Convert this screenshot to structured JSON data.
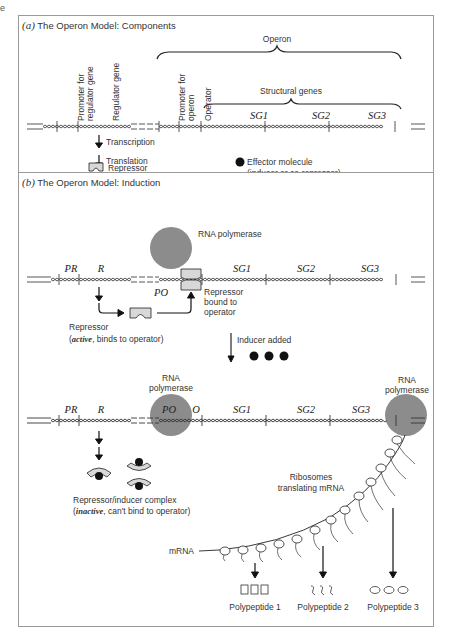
{
  "edge_fragment": "e",
  "panel_a": {
    "letter": "(a)",
    "title": "The Operon Model: Components",
    "operon_label": "Operon",
    "structural_genes_label": "Structural genes",
    "vertical_labels": [
      "Promoter for regulator gene",
      "Regulator gene",
      "Promoter for operon",
      "Operator"
    ],
    "vertical_lines": [
      [
        "Promoter for",
        "regulator gene"
      ],
      [
        "Regulator gene"
      ],
      [
        "Promoter for",
        "operon"
      ],
      [
        "Operator"
      ]
    ],
    "genes": [
      "SG1",
      "SG2",
      "SG3"
    ],
    "steps": [
      "Transcription",
      "Translation"
    ],
    "repressor_label": "Repressor",
    "effector_label_1": "Effector molecule",
    "effector_label_2": "(inducer or co-repressor)"
  },
  "panel_b": {
    "letter": "(b)",
    "title": "The Operon Model: Induction",
    "top_strand": {
      "rna_polymerase": "RNA polymerase",
      "genes": [
        "PR",
        "R",
        "PO",
        "SG1",
        "SG2",
        "SG3"
      ],
      "repressor_bound": [
        "Repressor",
        "bound to",
        "operator"
      ],
      "repressor_label": "Repressor",
      "repressor_state_word": "active",
      "repressor_state_rest": ", binds to operator)",
      "repressor_state_open": "("
    },
    "inducer_added": "Inducer added",
    "bottom_strand": {
      "rna_polymerase_1": [
        "RNA",
        "polymerase"
      ],
      "rna_polymerase_2": [
        "RNA",
        "polymerase"
      ],
      "genes": [
        "PR",
        "R",
        "PO",
        "O",
        "SG1",
        "SG2",
        "SG3"
      ],
      "complex_label": "Repressor/inducer complex",
      "complex_state_open": "(",
      "complex_state_word": "inactive",
      "complex_state_rest": ", can't bind to operator)",
      "ribosomes_label": [
        "Ribosomes",
        "translating mRNA"
      ],
      "mrna_label": "mRNA",
      "polypeptides": [
        "Polypeptide 1",
        "Polypeptide 2",
        "Polypeptide 3"
      ]
    }
  },
  "colors": {
    "polymerase": "#8c8c8c",
    "repressor_fill": "#d8d8d8",
    "border": "#9a9a9a",
    "ink": "#222222"
  }
}
